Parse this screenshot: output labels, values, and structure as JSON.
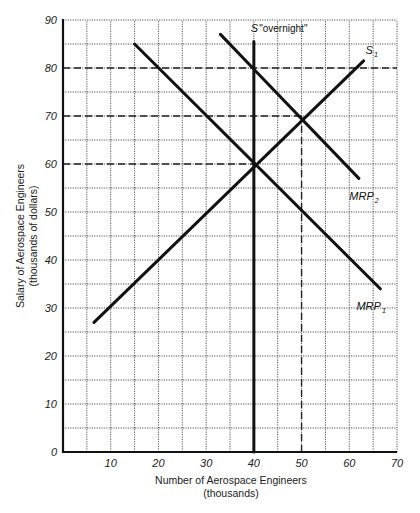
{
  "chart_data": {
    "type": "line",
    "title": "",
    "xlabel": "Number of Aerospace Engineers",
    "xlabel_sub": "(thousands)",
    "ylabel": "Salary of Aerospace Engineers",
    "ylabel_sub": "(thousands of dollars)",
    "xlim": [
      0,
      70
    ],
    "ylim": [
      0,
      90
    ],
    "x_ticks": [
      10,
      20,
      30,
      40,
      50,
      60,
      70
    ],
    "y_ticks": [
      0,
      10,
      20,
      30,
      40,
      50,
      60,
      70,
      80,
      90
    ],
    "grid": true,
    "grid_step": 5,
    "series": [
      {
        "name": "S \"overnight\"",
        "label_main": "S",
        "label_rest": "\"overnight\"",
        "points": [
          [
            40,
            0
          ],
          [
            40,
            85.5
          ]
        ]
      },
      {
        "name": "S1",
        "label_main": "S",
        "label_sub": "1",
        "points": [
          [
            6.5,
            27
          ],
          [
            63,
            81.5
          ]
        ]
      },
      {
        "name": "MRP1",
        "label_main": "MRP",
        "label_sub": "1",
        "points": [
          [
            15,
            85
          ],
          [
            66.5,
            34
          ]
        ]
      },
      {
        "name": "MRP2",
        "label_main": "MRP",
        "label_sub": "2",
        "points": [
          [
            33,
            87
          ],
          [
            62,
            57
          ]
        ]
      }
    ],
    "reference_lines": [
      {
        "type": "horizontal",
        "y": 80,
        "from_x": 0,
        "to_x": 70,
        "style": "dashed"
      },
      {
        "type": "horizontal",
        "y": 70,
        "from_x": 0,
        "to_x": 50,
        "style": "dashed"
      },
      {
        "type": "horizontal",
        "y": 60,
        "from_x": 0,
        "to_x": 40,
        "style": "dashed"
      },
      {
        "type": "vertical",
        "x": 50,
        "from_y": 0,
        "to_y": 70,
        "style": "dashed"
      }
    ],
    "equilibria": [
      {
        "x": 40,
        "y": 60,
        "label": "S1 ∩ MRP1 ∩ S overnight"
      },
      {
        "x": 40,
        "y": 80,
        "label": "S overnight ∩ MRP2"
      },
      {
        "x": 50,
        "y": 70,
        "label": "S1 ∩ MRP2"
      }
    ]
  }
}
